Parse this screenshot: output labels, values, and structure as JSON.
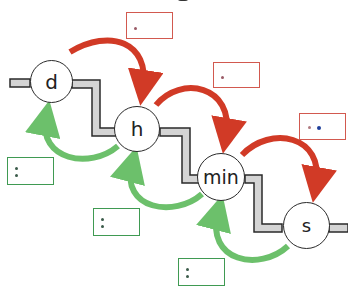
{
  "diagram": {
    "title_fragment": "g",
    "units": [
      {
        "id": "d",
        "label": "d"
      },
      {
        "id": "h",
        "label": "h"
      },
      {
        "id": "min",
        "label": "min"
      },
      {
        "id": "s",
        "label": "s"
      }
    ],
    "forward_arrows": [
      {
        "from": "d",
        "to": "h",
        "operation": "·",
        "color": "#d13a26"
      },
      {
        "from": "h",
        "to": "min",
        "operation": "·",
        "color": "#d13a26"
      },
      {
        "from": "min",
        "to": "s",
        "operation": "·",
        "color": "#d13a26"
      }
    ],
    "backward_arrows": [
      {
        "from": "h",
        "to": "d",
        "operation": ":",
        "color": "#6cc06b"
      },
      {
        "from": "min",
        "to": "h",
        "operation": ":",
        "color": "#6cc06b"
      },
      {
        "from": "s",
        "to": "min",
        "operation": ":",
        "color": "#6cc06b"
      }
    ],
    "colors": {
      "forward": "#d13a26",
      "backward": "#6cc06b",
      "box_red_border": "#d2594f",
      "box_green_border": "#3f9a52",
      "stair_fill": "#d4d4d4",
      "stair_stroke": "#2a2a2a",
      "blue_dot": "#1f3f9a"
    }
  }
}
